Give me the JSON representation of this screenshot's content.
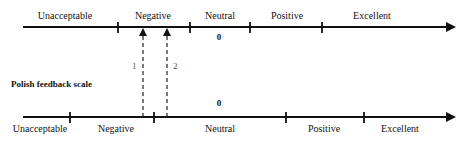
{
  "top_scale": {
    "labels": [
      {
        "text": "Unacceptable",
        "x": 65
      },
      {
        "text": "Negative",
        "x": 153
      },
      {
        "text": "Neutral",
        "x": 220
      },
      {
        "text": "Positive",
        "x": 287
      },
      {
        "text": "Excellent",
        "x": 372
      }
    ],
    "zero_label": "0",
    "ticks_x": [
      118,
      190,
      250,
      322
    ]
  },
  "bottom_scale": {
    "title": "Polish feedback scale",
    "labels": [
      {
        "text": "Unacceptable",
        "x": 40
      },
      {
        "text": "Negative",
        "x": 116
      },
      {
        "text": "Neutral",
        "x": 220
      },
      {
        "text": "Positive",
        "x": 324
      },
      {
        "text": "Excellent",
        "x": 400
      }
    ],
    "zero_label": "0",
    "ticks_x": [
      70,
      154,
      286,
      364
    ]
  },
  "mappings": [
    {
      "label": "1",
      "x": 143
    },
    {
      "label": "2",
      "x": 167
    }
  ],
  "colors": {
    "line": "#111111",
    "dashed": "#222222",
    "number": "#555555"
  }
}
